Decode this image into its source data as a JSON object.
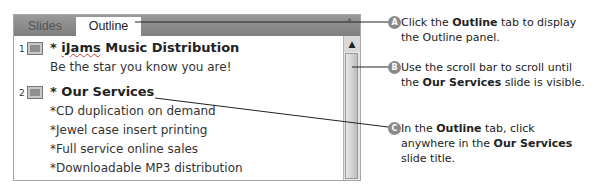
{
  "panel": {
    "tabs": [
      {
        "label": "Slides",
        "active": false
      },
      {
        "label": "Outline",
        "active": true
      }
    ],
    "close_icon": "chevron-up-icon",
    "slides": [
      {
        "number": "1",
        "title_prefix": "* ",
        "title_misspelled": "iJams",
        "title_rest": " Music Distribution",
        "bullets": [
          "Be the star you know you are!"
        ]
      },
      {
        "number": "2",
        "title_prefix": "* ",
        "title_misspelled": "",
        "title_rest": "Our Services",
        "bullets": [
          "*CD duplication on demand",
          "*Jewel case insert printing",
          "*Full service online sales",
          "*Downloadable MP3 distribution"
        ]
      }
    ],
    "scrollbar": {
      "up_arrow": "▲"
    }
  },
  "callouts": [
    {
      "badge": "A",
      "parts": [
        {
          "t": "Click the ",
          "b": false
        },
        {
          "t": "Outline",
          "b": true
        },
        {
          "t": " tab to display the Outline panel.",
          "b": false
        }
      ]
    },
    {
      "badge": "B",
      "parts": [
        {
          "t": "Use the scroll bar to scroll until the ",
          "b": false
        },
        {
          "t": "Our Services",
          "b": true
        },
        {
          "t": " slide is visible.",
          "b": false
        }
      ]
    },
    {
      "badge": "C",
      "parts": [
        {
          "t": "In the ",
          "b": false
        },
        {
          "t": "Outline",
          "b": true
        },
        {
          "t": " tab, click anywhere in the ",
          "b": false
        },
        {
          "t": "Our Services",
          "b": true
        },
        {
          "t": " slide title.",
          "b": false
        }
      ]
    }
  ],
  "colors": {
    "tabbar": "#8c8c8c",
    "badge": "#8a8a8a",
    "spellcheck": "#c04040"
  }
}
